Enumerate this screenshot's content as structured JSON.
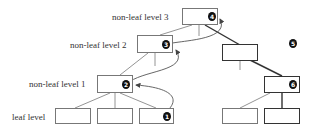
{
  "diagram": {
    "type": "B+ tree split propagation",
    "levels": {
      "level3": "non-leaf level 3",
      "level2": "non-leaf level 2",
      "level1": "non-leaf level 1",
      "leaf": "leaf level"
    },
    "steps": {
      "s1": "1",
      "s2": "2",
      "s3": "3",
      "s4": "4",
      "s5": "5",
      "s6": "6"
    },
    "colors": {
      "edge": "#777777",
      "bold_edge": "#333333",
      "badge": "#111111",
      "background": "#ffffff"
    }
  }
}
